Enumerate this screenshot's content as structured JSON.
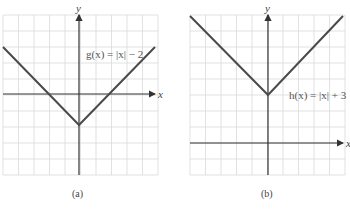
{
  "panels": [
    {
      "id": "a",
      "caption": "(a)",
      "equation": "g(x) = |x| − 2",
      "x_axis_label": "x",
      "y_axis_label": "y",
      "function": "abs_shift",
      "vertical_shift": -2,
      "grid": {
        "x_min": -5,
        "x_max": 5,
        "y_min": -5,
        "y_max": 5
      },
      "vertex": [
        0,
        -2
      ],
      "line_color": "#4a4a4a"
    },
    {
      "id": "b",
      "caption": "(b)",
      "equation": "h(x) = |x| + 3",
      "x_axis_label": "x",
      "y_axis_label": "y",
      "function": "abs_shift",
      "vertical_shift": 3,
      "grid": {
        "x_min": -5,
        "x_max": 5,
        "y_min": -2,
        "y_max": 8
      },
      "vertex": [
        0,
        3
      ],
      "line_color": "#4a4a4a"
    }
  ]
}
